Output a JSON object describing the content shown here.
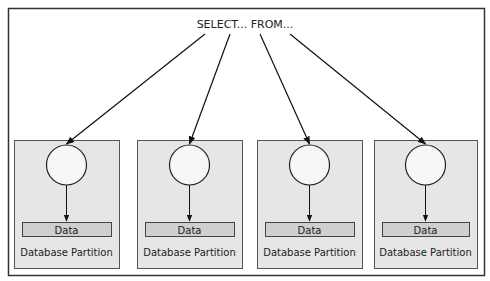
{
  "query": {
    "label": "SELECT... FROM..."
  },
  "partitions": [
    {
      "data_label": "Data",
      "label": "Database Partition"
    },
    {
      "data_label": "Data",
      "label": "Database Partition"
    },
    {
      "data_label": "Data",
      "label": "Database Partition"
    },
    {
      "data_label": "Data",
      "label": "Database Partition"
    }
  ],
  "colors": {
    "frame": "#333333",
    "partition_fill": "#e6e6e6",
    "partition_stroke": "#555555",
    "data_fill": "#cfcfcf",
    "node_fill": "#f7f7f7",
    "line": "#111111"
  }
}
